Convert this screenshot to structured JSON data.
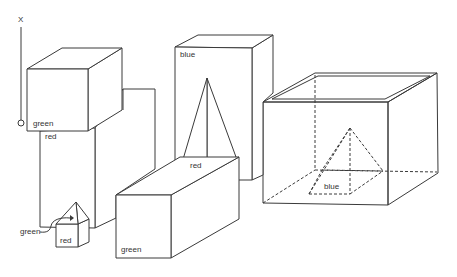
{
  "axis": {
    "label": "X"
  },
  "objects": [
    {
      "id": "cube-top-left",
      "shape": "cube",
      "label": "green"
    },
    {
      "id": "tall-block-left",
      "shape": "block",
      "label": "red"
    },
    {
      "id": "small-pyramid",
      "shape": "pyramid",
      "label": "green"
    },
    {
      "id": "small-cube",
      "shape": "cube",
      "label": "red"
    },
    {
      "id": "tall-block-center",
      "shape": "block",
      "label": "blue"
    },
    {
      "id": "tall-pyramid",
      "shape": "pyramid",
      "label": "red"
    },
    {
      "id": "long-block-front",
      "shape": "block",
      "label": "green"
    },
    {
      "id": "open-box",
      "shape": "box",
      "label": ""
    },
    {
      "id": "pyramid-in-box",
      "shape": "pyramid",
      "label": "blue"
    }
  ]
}
